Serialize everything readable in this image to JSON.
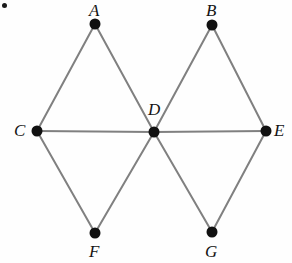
{
  "figure": {
    "type": "undirected-graph-diagram",
    "width": 292,
    "height": 263,
    "background_color": "#fefefe",
    "edge_color": "#808080",
    "edge_width": 2,
    "vertex_color": "#111111",
    "vertex_radius": 5.5,
    "label_color": "#141414",
    "label_style": "italic-serif"
  },
  "corner_mark": {
    "name": "stray-dot",
    "x": 2,
    "y": 3
  },
  "vertices": [
    {
      "id": "A",
      "label": "A",
      "cx": 95,
      "cy": 24,
      "label_x": 89,
      "label_y": 2
    },
    {
      "id": "B",
      "label": "B",
      "cx": 212,
      "cy": 25,
      "label_x": 206,
      "label_y": 2
    },
    {
      "id": "C",
      "label": "C",
      "cx": 37,
      "cy": 131,
      "label_x": 14,
      "label_y": 122
    },
    {
      "id": "D",
      "label": "D",
      "cx": 154,
      "cy": 132,
      "label_x": 148,
      "label_y": 101
    },
    {
      "id": "E",
      "label": "E",
      "cx": 266,
      "cy": 131,
      "label_x": 274,
      "label_y": 122
    },
    {
      "id": "F",
      "label": "F",
      "cx": 95,
      "cy": 233,
      "label_x": 89,
      "label_y": 243
    },
    {
      "id": "G",
      "label": "G",
      "cx": 212,
      "cy": 232,
      "label_x": 205,
      "label_y": 243
    }
  ],
  "edges": [
    {
      "from": "A",
      "to": "C"
    },
    {
      "from": "A",
      "to": "D"
    },
    {
      "from": "B",
      "to": "D"
    },
    {
      "from": "B",
      "to": "E"
    },
    {
      "from": "C",
      "to": "D"
    },
    {
      "from": "D",
      "to": "E"
    },
    {
      "from": "C",
      "to": "F"
    },
    {
      "from": "D",
      "to": "F"
    },
    {
      "from": "D",
      "to": "G"
    },
    {
      "from": "E",
      "to": "G"
    }
  ]
}
